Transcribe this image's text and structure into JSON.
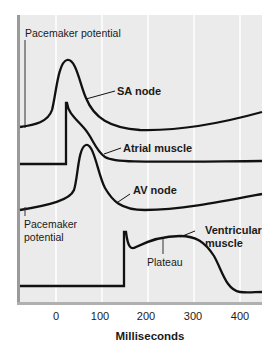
{
  "figure": {
    "panel_color": "#ebebeb",
    "panel_border_color": "#b5b5b5",
    "gridline_color": "#ffffff",
    "trace_color": "#111111",
    "x_axis": {
      "label": "Milliseconds",
      "ticks": [
        "0",
        "100",
        "200",
        "300",
        "400"
      ]
    },
    "annotations": {
      "pacemaker_top": "Pacemaker potential",
      "pacemaker_bottom_line1": "Pacemaker",
      "pacemaker_bottom_line2": "potential",
      "plateau": "Plateau"
    },
    "traces": [
      {
        "name": "SA node",
        "label": "SA node"
      },
      {
        "name": "Atrial muscle",
        "label": "Atrial muscle"
      },
      {
        "name": "AV node",
        "label": "AV node"
      },
      {
        "name": "Ventricular muscle",
        "label_line1": "Ventricular",
        "label_line2": "muscle"
      }
    ]
  }
}
